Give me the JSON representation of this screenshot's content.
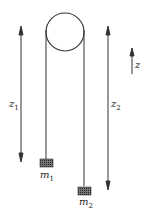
{
  "diagram": {
    "labels": {
      "z1": "z",
      "z1_sub": "1",
      "z2": "z",
      "z2_sub": "2",
      "z_axis": "z",
      "m1": "m",
      "m1_sub": "1",
      "m2": "m",
      "m2_sub": "2"
    },
    "colors": {
      "line": "#333333",
      "mass": "#555555"
    }
  }
}
